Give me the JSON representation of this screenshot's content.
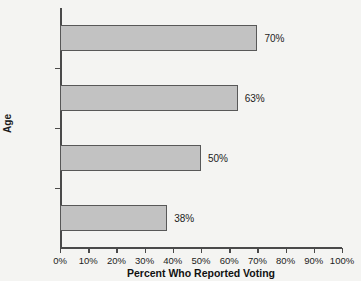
{
  "chart_data": {
    "type": "bar",
    "orientation": "horizontal",
    "title": "",
    "xlabel": "Percent Who Reported Voting",
    "ylabel": "Age",
    "categories": [
      "65+",
      "45–64",
      "25–44",
      "18–24"
    ],
    "values": [
      70,
      63,
      50,
      38
    ],
    "data_labels": [
      "70%",
      "63%",
      "50%",
      "38%"
    ],
    "xlim": [
      0,
      100
    ],
    "xticks": [
      0,
      10,
      20,
      30,
      40,
      50,
      60,
      70,
      80,
      90,
      100
    ],
    "xtick_labels": [
      "0%",
      "10%",
      "20%",
      "30%",
      "40%",
      "50%",
      "60%",
      "70%",
      "80%",
      "90%",
      "100%"
    ],
    "grid": false,
    "legend": null,
    "bar_fill_color": "#c2c2c2",
    "bar_border_color": "#585858",
    "background_color": "#f4f4f2",
    "text_color": "#1c1c1c"
  }
}
